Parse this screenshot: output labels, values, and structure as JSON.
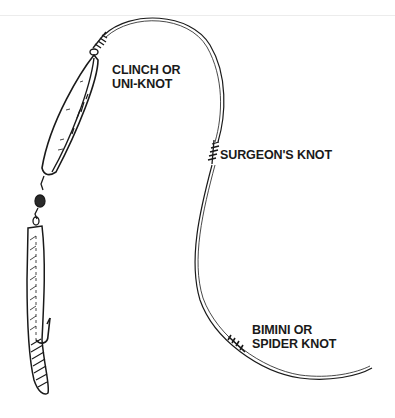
{
  "diagram": {
    "labels": {
      "clinch": {
        "line1": "CLINCH OR",
        "line2": "UNI-KNOT"
      },
      "surgeon": {
        "line1": "SURGEON'S KNOT"
      },
      "bimini": {
        "line1": "BIMINI OR",
        "line2": "SPIDER KNOT"
      }
    },
    "components": [
      "lure",
      "swivel",
      "bait-strip",
      "hook",
      "leader-line",
      "main-line"
    ],
    "colors": {
      "ink": "#1a1a1a",
      "background": "#ffffff"
    }
  }
}
